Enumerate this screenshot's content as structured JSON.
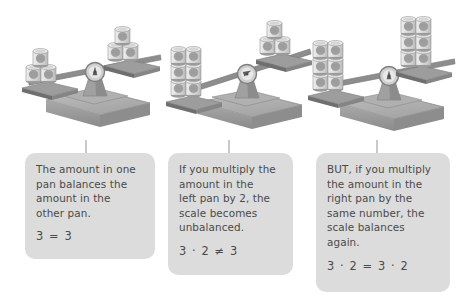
{
  "figure": {
    "palette": {
      "background": "#ffffff",
      "callout_fill": "#dcdcdc",
      "text": "#4a4a4a",
      "connector": "#c9c9c9",
      "base_light": "#b3b3b3",
      "base_mid": "#9a9a9a",
      "base_dark": "#7f7f7f",
      "beam": "#8d8d8d",
      "pan": "#7c7c7c",
      "can_body": "#d8d8d8",
      "can_label": "#9e9e9e",
      "can_outline": "#8a8a8a"
    }
  },
  "scales": [
    {
      "id": "scale-balanced",
      "name": "balanced-scale",
      "state": "balanced",
      "tilt_degrees": -7,
      "left_pan": {
        "cans": 3,
        "columns": 2,
        "rows": 2,
        "arrangement": "pyramid"
      },
      "right_pan": {
        "cans": 3,
        "columns": 2,
        "rows": 2,
        "arrangement": "pyramid"
      }
    },
    {
      "id": "scale-unbalanced",
      "name": "unbalanced-scale",
      "state": "unbalanced-left-heavy",
      "tilt_degrees": -13,
      "left_pan": {
        "cans": 6,
        "columns": 2,
        "rows": 3,
        "arrangement": "stack"
      },
      "right_pan": {
        "cans": 3,
        "columns": 2,
        "rows": 2,
        "arrangement": "pyramid"
      }
    },
    {
      "id": "scale-rebalanced",
      "name": "rebalanced-scale",
      "state": "balanced",
      "tilt_degrees": -7,
      "left_pan": {
        "cans": 6,
        "columns": 2,
        "rows": 3,
        "arrangement": "stack"
      },
      "right_pan": {
        "cans": 6,
        "columns": 2,
        "rows": 3,
        "arrangement": "stack"
      }
    }
  ],
  "callouts": [
    {
      "id": "callout-1",
      "name": "callout-balanced",
      "text": "The amount in one\npan balances the\namount in the\nother pan.",
      "equation": "3 = 3"
    },
    {
      "id": "callout-2",
      "name": "callout-unbalanced",
      "text": "If you multiply the\namount in the\nleft pan by 2, the\nscale becomes\nunbalanced.",
      "equation": "3 · 2 ≠ 3"
    },
    {
      "id": "callout-3",
      "name": "callout-rebalanced",
      "text": "BUT, if you multiply\nthe amount in the\nright pan by the\nsame number, the\nscale balances\nagain.",
      "equation": "3 · 2 = 3 · 2"
    }
  ]
}
